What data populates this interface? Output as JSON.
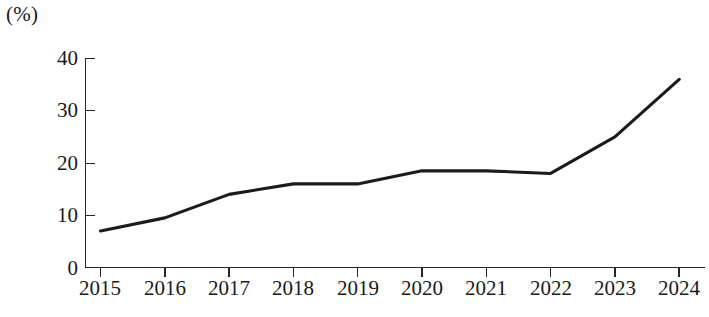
{
  "chart_data": {
    "type": "line",
    "title": "",
    "subtitle": "",
    "xlabel": "",
    "ylabel": "(%)",
    "unit_label": "(%)",
    "categories": [
      "2015",
      "2016",
      "2017",
      "2018",
      "2019",
      "2020",
      "2021",
      "2022",
      "2023",
      "2024"
    ],
    "x": [
      2015,
      2016,
      2017,
      2018,
      2019,
      2020,
      2021,
      2022,
      2023,
      2024
    ],
    "values": [
      7,
      9.5,
      14,
      16,
      16,
      18.5,
      18.5,
      18,
      25,
      36
    ],
    "series": [
      {
        "name": "",
        "values": [
          7,
          9.5,
          14,
          16,
          16,
          18.5,
          18.5,
          18,
          25,
          36
        ]
      }
    ],
    "ylim": [
      0,
      40
    ],
    "ytick_values": [
      0,
      10,
      20,
      30,
      40
    ],
    "ytick_labels": [
      "0",
      "10",
      "20",
      "30",
      "40"
    ],
    "xtick_labels": [
      "2015",
      "2016",
      "2017",
      "2018",
      "2019",
      "2020",
      "2021",
      "2022",
      "2023",
      "2024"
    ],
    "grid": false,
    "legend": false,
    "legend_position": "none",
    "line_color": "#1b1b1b",
    "axis_color": "#262626",
    "background_color": "#ffffff",
    "markers": false,
    "annotations": []
  }
}
